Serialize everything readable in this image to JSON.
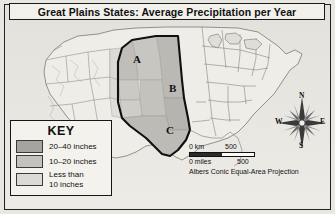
{
  "title": {
    "text": "Great Plains States: Average Precipitation per Year"
  },
  "map": {
    "region_labels": [
      {
        "id": "A",
        "text": "A"
      },
      {
        "id": "B",
        "text": "B"
      },
      {
        "id": "C",
        "text": "C"
      }
    ]
  },
  "key": {
    "heading": "KEY",
    "entries": [
      {
        "label": "20–40 inches",
        "color": "#a6a49f"
      },
      {
        "label": "10–20 inches",
        "color": "#c4c2bd"
      },
      {
        "label": "Less than\n10 inches",
        "color": "#dcdad5"
      }
    ]
  },
  "scale": {
    "km_zero": "0 km",
    "km_max": "500",
    "miles_zero": "0 miles",
    "miles_max": "500",
    "projection": "Albers Conic Equal-Area Projection"
  },
  "compass": {
    "north": "N",
    "east": "E",
    "south": "S",
    "west": "W"
  },
  "colors": {
    "shade_high": "#a6a49f",
    "shade_mid": "#c4c2bd",
    "shade_low": "#dcdad5",
    "land": "#efedE8",
    "outline": "#1a1a1a",
    "background": "#e9e7e2"
  }
}
